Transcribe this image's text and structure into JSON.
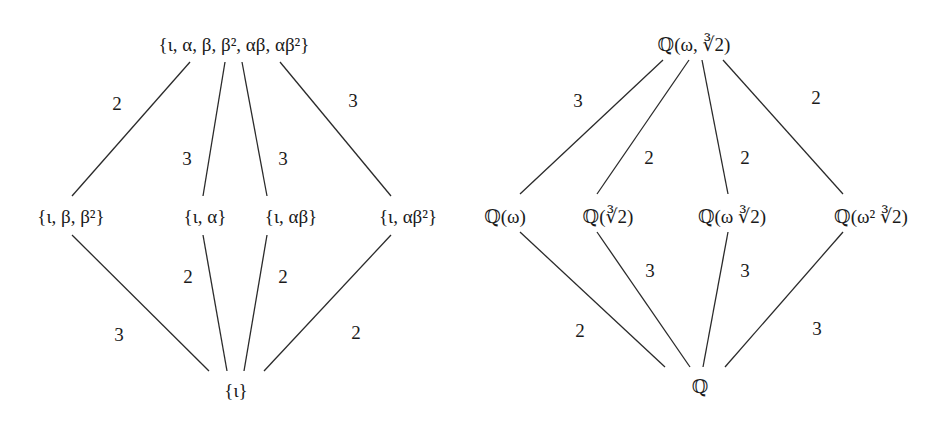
{
  "diagram": {
    "type": "lattice-diagram",
    "left": {
      "title": "Subgroup lattice",
      "nodes": {
        "top": "{ι, α, β, β², αβ, αβ²}",
        "m1": "{ι, β, β²}",
        "m2": "{ι, α}",
        "m3": "{ι, αβ}",
        "m4": "{ι, αβ²}",
        "bottom": "{ι}"
      },
      "top_edges": [
        {
          "from": "top",
          "to": "m1",
          "label": "2"
        },
        {
          "from": "top",
          "to": "m2",
          "label": "3"
        },
        {
          "from": "top",
          "to": "m3",
          "label": "3"
        },
        {
          "from": "top",
          "to": "m4",
          "label": "3"
        }
      ],
      "bottom_edges": [
        {
          "from": "m1",
          "to": "bottom",
          "label": "3"
        },
        {
          "from": "m2",
          "to": "bottom",
          "label": "2"
        },
        {
          "from": "m3",
          "to": "bottom",
          "label": "2"
        },
        {
          "from": "m4",
          "to": "bottom",
          "label": "2"
        }
      ]
    },
    "right": {
      "title": "Field lattice",
      "nodes": {
        "top": "ℚ(ω, ∛2)",
        "m1": "ℚ(ω)",
        "m2": "ℚ(∛2)",
        "m3": "ℚ(ω ∛2)",
        "m4": "ℚ(ω² ∛2)",
        "bottom": "ℚ"
      },
      "top_edges": [
        {
          "from": "top",
          "to": "m1",
          "label": "3"
        },
        {
          "from": "top",
          "to": "m2",
          "label": "2"
        },
        {
          "from": "top",
          "to": "m3",
          "label": "2"
        },
        {
          "from": "top",
          "to": "m4",
          "label": "2"
        }
      ],
      "bottom_edges": [
        {
          "from": "m1",
          "to": "bottom",
          "label": "2"
        },
        {
          "from": "m2",
          "to": "bottom",
          "label": "3"
        },
        {
          "from": "m3",
          "to": "bottom",
          "label": "3"
        },
        {
          "from": "m4",
          "to": "bottom",
          "label": "3"
        }
      ]
    }
  }
}
